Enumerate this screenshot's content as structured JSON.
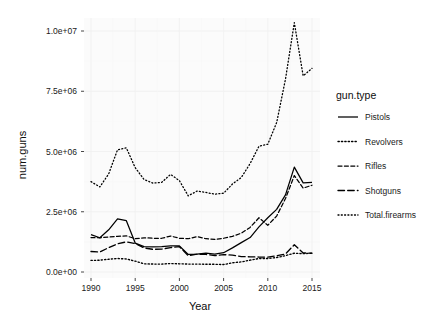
{
  "chart_data": {
    "type": "line",
    "title": "",
    "xlabel": "Year",
    "ylabel": "num.guns",
    "legend_title": "gun.type",
    "legend_position": "right",
    "grid": true,
    "xlim": [
      1989,
      2016
    ],
    "ylim": [
      0,
      11000000
    ],
    "x_ticks": [
      1990,
      1995,
      2000,
      2005,
      2010,
      2015
    ],
    "x_tick_labels": [
      "1990",
      "1995",
      "2000",
      "2005",
      "2010",
      "2015"
    ],
    "y_ticks": [
      0,
      2500000,
      5000000,
      7500000,
      10000000
    ],
    "y_tick_labels": [
      "0.0e+00",
      "2.5e+06",
      "5.0e+06",
      "7.5e+06",
      "1.0e+07"
    ],
    "x": [
      1990,
      1991,
      1992,
      1993,
      1994,
      1995,
      1996,
      1997,
      1998,
      1999,
      2000,
      2001,
      2002,
      2003,
      2004,
      2005,
      2006,
      2007,
      2008,
      2009,
      2010,
      2011,
      2012,
      2013,
      2014,
      2015
    ],
    "series": [
      {
        "name": "Pistols",
        "dash": "solid",
        "values": [
          1550000,
          1420000,
          1750000,
          2200000,
          2130000,
          1200000,
          1050000,
          1040000,
          1050000,
          1080000,
          1080000,
          730000,
          740000,
          780000,
          740000,
          800000,
          1000000,
          1220000,
          1430000,
          1870000,
          2250000,
          2600000,
          3200000,
          4350000,
          3700000,
          3720000
        ]
      },
      {
        "name": "Revolvers",
        "dash": "dotted",
        "values": [
          480000,
          490000,
          530000,
          560000,
          540000,
          450000,
          340000,
          330000,
          330000,
          350000,
          340000,
          330000,
          330000,
          320000,
          320000,
          310000,
          380000,
          420000,
          490000,
          560000,
          560000,
          600000,
          680000,
          780000,
          760000,
          780000
        ]
      },
      {
        "name": "Rifles",
        "dash": "dashed",
        "values": [
          1430000,
          1420000,
          1450000,
          1480000,
          1500000,
          1380000,
          1420000,
          1400000,
          1400000,
          1490000,
          1400000,
          1380000,
          1470000,
          1380000,
          1350000,
          1400000,
          1480000,
          1610000,
          1850000,
          2250000,
          1940000,
          2320000,
          3050000,
          4000000,
          3480000,
          3600000
        ]
      },
      {
        "name": "Shotguns",
        "dash": "longdash",
        "values": [
          850000,
          830000,
          1010000,
          1170000,
          1250000,
          1180000,
          1000000,
          940000,
          950000,
          1010000,
          1050000,
          680000,
          740000,
          730000,
          680000,
          720000,
          700000,
          640000,
          630000,
          620000,
          620000,
          670000,
          750000,
          1130000,
          790000,
          780000
        ]
      },
      {
        "name": "Total.firearms",
        "dash": "fine-dotted",
        "values": [
          3750000,
          3530000,
          4070000,
          5070000,
          5150000,
          4330000,
          3840000,
          3690000,
          3720000,
          4050000,
          3790000,
          3160000,
          3360000,
          3300000,
          3230000,
          3270000,
          3650000,
          3920000,
          4500000,
          5220000,
          5300000,
          6200000,
          8000000,
          10350000,
          8140000,
          8450000
        ]
      }
    ],
    "legend_items": [
      {
        "label": "Pistols",
        "dash": "solid"
      },
      {
        "label": "Revolvers",
        "dash": "dotted"
      },
      {
        "label": "Rifles",
        "dash": "dashed"
      },
      {
        "label": "Shotguns",
        "dash": "longdash"
      },
      {
        "label": "Total.firearms",
        "dash": "fine-dotted"
      }
    ],
    "colors": {
      "line": "#000000",
      "panel_bg": "#fbfbfb",
      "grid_major": "#f0f0f0",
      "plot_bg": "#ffffff",
      "text": "#1a1a1a"
    }
  }
}
